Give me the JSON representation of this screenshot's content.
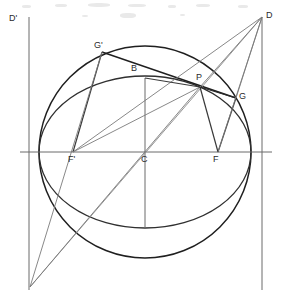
{
  "figure": {
    "kind": "geometry-construction",
    "width": 283,
    "height": 302,
    "background": "#ffffff",
    "stroke_dark": "#1f1f1f",
    "stroke_light": "#6b6b6b",
    "stroke_medium": "#3a3a3a"
  },
  "labels": [
    {
      "id": "D-prime",
      "text": "D'",
      "x": 9,
      "y": 14
    },
    {
      "id": "D",
      "text": "D",
      "x": 266,
      "y": 11
    },
    {
      "id": "G-prime",
      "text": "G'",
      "x": 94,
      "y": 41
    },
    {
      "id": "B",
      "text": "B",
      "x": 131,
      "y": 64
    },
    {
      "id": "P",
      "text": "P",
      "x": 196,
      "y": 73
    },
    {
      "id": "G",
      "text": "G",
      "x": 239,
      "y": 92
    },
    {
      "id": "F-prime",
      "text": "F'",
      "x": 68,
      "y": 155
    },
    {
      "id": "C",
      "text": "C",
      "x": 141,
      "y": 155
    },
    {
      "id": "F",
      "text": "F",
      "x": 213,
      "y": 155
    }
  ],
  "points": {
    "C": {
      "x": 145,
      "y": 152
    },
    "F": {
      "x": 218,
      "y": 152
    },
    "F_prime": {
      "x": 73,
      "y": 152
    },
    "B": {
      "x": 145,
      "y": 78
    },
    "P": {
      "x": 200,
      "y": 87
    },
    "G": {
      "x": 236,
      "y": 98
    },
    "G_prime": {
      "x": 102,
      "y": 52
    },
    "D": {
      "x": 262,
      "y": 17
    },
    "D_prime": {
      "x": 29,
      "y": 17
    },
    "V_left": {
      "x": 30,
      "y": 287
    },
    "A_right": {
      "x": 251,
      "y": 152
    },
    "A_left": {
      "x": 39,
      "y": 152
    },
    "E_bottom": {
      "x": 145,
      "y": 228
    }
  },
  "curves": {
    "circle": {
      "cx": 145,
      "cy": 152,
      "r": 106
    },
    "ellipse": {
      "cx": 145,
      "cy": 152,
      "rx": 106,
      "ry": 76
    }
  },
  "axes": {
    "horizontal": {
      "x1": 20,
      "y1": 152,
      "x2": 272,
      "y2": 152
    },
    "directrix_right": {
      "x1": 262,
      "y1": 17,
      "x2": 262,
      "y2": 290
    },
    "directrix_left": {
      "x1": 29,
      "y1": 17,
      "x2": 29,
      "y2": 290
    },
    "semi_minor": {
      "x1": 145,
      "y1": 78,
      "x2": 145,
      "y2": 228
    }
  },
  "segments": [
    {
      "id": "seg-Gp-P",
      "x1": 102,
      "y1": 52,
      "x2": 236,
      "y2": 98,
      "weight": "dark"
    },
    {
      "id": "seg-Gp-Fp",
      "x1": 102,
      "y1": 52,
      "x2": 73,
      "y2": 152,
      "weight": "medium"
    },
    {
      "id": "seg-Gp-Vleft",
      "x1": 102,
      "y1": 52,
      "x2": 30,
      "y2": 287,
      "weight": "light"
    },
    {
      "id": "seg-Fp-P",
      "x1": 73,
      "y1": 152,
      "x2": 200,
      "y2": 87,
      "weight": "light"
    },
    {
      "id": "seg-Fp-D",
      "x1": 73,
      "y1": 152,
      "x2": 262,
      "y2": 17,
      "weight": "light"
    },
    {
      "id": "seg-Vleft-D",
      "x1": 30,
      "y1": 287,
      "x2": 262,
      "y2": 17,
      "weight": "light"
    },
    {
      "id": "seg-Vleft-P",
      "x1": 30,
      "y1": 287,
      "x2": 200,
      "y2": 87,
      "weight": "light"
    },
    {
      "id": "seg-P-F",
      "x1": 200,
      "y1": 87,
      "x2": 218,
      "y2": 152,
      "weight": "medium"
    },
    {
      "id": "seg-P-G",
      "x1": 200,
      "y1": 87,
      "x2": 236,
      "y2": 98,
      "weight": "medium"
    },
    {
      "id": "seg-P-D",
      "x1": 200,
      "y1": 87,
      "x2": 262,
      "y2": 17,
      "weight": "light"
    },
    {
      "id": "seg-F-G",
      "x1": 218,
      "y1": 152,
      "x2": 236,
      "y2": 98,
      "weight": "medium"
    },
    {
      "id": "seg-F-D",
      "x1": 218,
      "y1": 152,
      "x2": 262,
      "y2": 17,
      "weight": "light"
    },
    {
      "id": "seg-G-D",
      "x1": 236,
      "y1": 98,
      "x2": 262,
      "y2": 17,
      "weight": "light"
    },
    {
      "id": "seg-B-P",
      "x1": 145,
      "y1": 78,
      "x2": 200,
      "y2": 87,
      "weight": "medium"
    }
  ],
  "specks": [
    {
      "x": 22,
      "y": 5,
      "w": 9,
      "h": 3
    },
    {
      "x": 55,
      "y": 4,
      "w": 12,
      "h": 3
    },
    {
      "x": 88,
      "y": 3,
      "w": 22,
      "h": 4
    },
    {
      "x": 128,
      "y": 4,
      "w": 18,
      "h": 3
    },
    {
      "x": 168,
      "y": 5,
      "w": 8,
      "h": 3
    },
    {
      "x": 196,
      "y": 4,
      "w": 14,
      "h": 3
    },
    {
      "x": 238,
      "y": 5,
      "w": 10,
      "h": 3
    },
    {
      "x": 120,
      "y": 13,
      "w": 16,
      "h": 5
    },
    {
      "x": 82,
      "y": 15,
      "w": 6,
      "h": 2
    },
    {
      "x": 180,
      "y": 14,
      "w": 5,
      "h": 2
    }
  ]
}
